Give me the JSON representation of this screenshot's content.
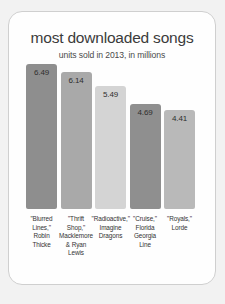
{
  "chart_data": {
    "type": "bar",
    "title": "most downloaded songs",
    "subtitle": "units sold in 2013, in millions",
    "xlabel": "",
    "ylabel": "",
    "ylim": [
      0,
      6.49
    ],
    "grid": false,
    "legend": false,
    "categories": [
      "\"Blurred Lines,\" Robin Thicke",
      "\"Thrift Shop,\" Macklemore & Ryan Lewis",
      "\"Radioactive,\" Imagine Dragons",
      "\"Cruise,\" Florida Georgia Line",
      "\"Royals,\" Lorde"
    ],
    "values": [
      6.49,
      6.14,
      5.49,
      4.69,
      4.41
    ],
    "value_labels": [
      "6.49",
      "6.14",
      "5.49",
      "4.69",
      "4.41"
    ],
    "bar_colors": [
      "#8e8e8e",
      "#a9a9a9",
      "#d4d4d4",
      "#8f8f8f",
      "#b9b9b9"
    ],
    "category_lines": [
      [
        "\"Blurred",
        "Lines,\"",
        "Robin",
        "Thicke"
      ],
      [
        "\"Thrift",
        "Shop,\"",
        "Macklemore",
        "& Ryan",
        "Lewis"
      ],
      [
        "\"Radioactive,\"",
        "Imagine",
        "Dragons"
      ],
      [
        "\"Cruise,\"",
        "Florida",
        "Georgia",
        "Line"
      ],
      [
        "\"Royals,\"",
        "Lorde"
      ]
    ]
  },
  "card": {
    "background_color": "#fefefe",
    "border_color": "#cfcfcf"
  }
}
